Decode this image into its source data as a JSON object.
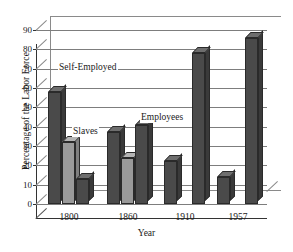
{
  "chart_data": {
    "type": "bar",
    "title": "",
    "xlabel": "Year",
    "ylabel": "Percentage of the Labor Force",
    "categories": [
      "1800",
      "1860",
      "1910",
      "1957"
    ],
    "ylim": [
      0,
      90
    ],
    "ytick_step": 10,
    "yticks": [
      0,
      10,
      20,
      30,
      40,
      50,
      60,
      70,
      80,
      90
    ],
    "grid": true,
    "legend": "annotations-on-plot",
    "series": [
      {
        "name": "Self-Employed",
        "color": "#4a4a4a",
        "values": [
          58,
          37,
          22,
          14
        ]
      },
      {
        "name": "Slaves",
        "color": "#9a9a9a",
        "values": [
          32,
          24,
          null,
          null
        ]
      },
      {
        "name": "Employees",
        "color": "#4a4a4a",
        "values": [
          13,
          41,
          78,
          86
        ]
      }
    ],
    "annotations": [
      {
        "text": "Self-Employed",
        "x": 58,
        "y": 62
      },
      {
        "text": "Slaves",
        "x": 72,
        "y": 126
      },
      {
        "text": "Employees",
        "x": 140,
        "y": 112
      }
    ]
  },
  "axis": {
    "y_tick_labels": [
      "90",
      "80",
      "70",
      "60",
      "50",
      "40",
      "30",
      "20",
      "10",
      "0"
    ],
    "x_tick_labels": [
      "1800",
      "1860",
      "1910",
      "1957"
    ],
    "y_title": "Percentage of the Labor Force",
    "x_title": "Year"
  },
  "colors": {
    "bar_dark": "#4a4a4a",
    "bar_light": "#9a9a9a",
    "bar_top": "#6e6e6e",
    "bar_side": "#3a3a3a",
    "grid": "#7d7d7d",
    "axis": "#333333",
    "background": "#ffffff"
  }
}
